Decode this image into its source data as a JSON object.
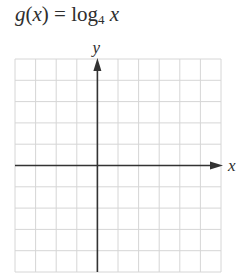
{
  "title": {
    "func": "g",
    "arg": "x",
    "equals": "=",
    "log": "log",
    "base": "4",
    "var": "x"
  },
  "chart_data": {
    "type": "line",
    "title": "g(x) = log4 x",
    "xlabel": "x",
    "ylabel": "y",
    "xlim": [
      -4,
      6
    ],
    "ylim": [
      -5,
      5
    ],
    "grid": true,
    "grid_step": 1,
    "series": [],
    "note": "Blank coordinate grid for graphing g(x) = log base 4 of x; no data plotted"
  },
  "colors": {
    "grid": "#d6d6d6",
    "axis": "#333333",
    "text": "#2e2e2e"
  }
}
